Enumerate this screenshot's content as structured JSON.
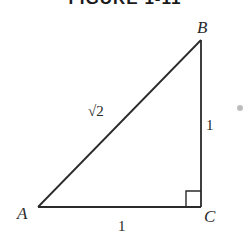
{
  "title": "FIGURE 1-11",
  "diagram": {
    "type": "right-triangle",
    "vertices": {
      "A": {
        "label": "A"
      },
      "B": {
        "label": "B"
      },
      "C": {
        "label": "C"
      }
    },
    "sides": {
      "hypotenuse_AB": {
        "label": "√2"
      },
      "vertical_BC": {
        "label": "1"
      },
      "base_AC": {
        "label": "1"
      }
    },
    "right_angle_at": "C",
    "colors": {
      "line": "#2a2a2a",
      "text": "#2a2a2a"
    }
  }
}
